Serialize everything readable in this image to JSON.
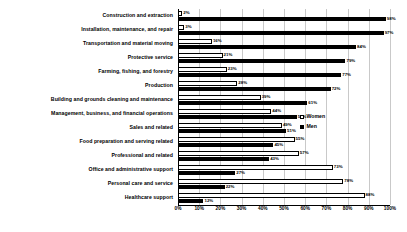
{
  "chart_data": {
    "type": "bar",
    "orientation": "horizontal",
    "title": "",
    "xlabel": "",
    "ylabel": "",
    "xlim": [
      0,
      100
    ],
    "grid": true,
    "legend_position": "right",
    "tick_labels": [
      "0%",
      "10%",
      "20%",
      "30%",
      "40%",
      "50%",
      "60%",
      "70%",
      "80%",
      "90%",
      "100%"
    ],
    "tick_values": [
      0,
      10,
      20,
      30,
      40,
      50,
      60,
      70,
      80,
      90,
      100
    ],
    "categories": [
      "Construction and extraction",
      "Installation, maintenance, and repair",
      "Transportation and material moving",
      "Protective service",
      "Farming, fishing, and forestry",
      "Production",
      "Building and grounds cleaning and maintenance",
      "Management, business, and financial operations",
      "Sales and related",
      "Food preparation and serving related",
      "Professional and related",
      "Office and administrative support",
      "Personal care and service",
      "Healthcare support"
    ],
    "series": [
      {
        "name": "Women",
        "color": "#ffffff",
        "values": [
          2,
          3,
          16,
          21,
          23,
          28,
          39,
          44,
          49,
          55,
          57,
          73,
          78,
          88
        ],
        "labels": [
          "2%",
          "3%",
          "16%",
          "21%",
          "23%",
          "28%",
          "39%",
          "44%",
          "49%",
          "55%",
          "57%",
          "73%",
          "78%",
          "88%"
        ]
      },
      {
        "name": "Men",
        "color": "#000000",
        "values": [
          98,
          97,
          84,
          79,
          77,
          72,
          61,
          56,
          51,
          45,
          43,
          27,
          22,
          12
        ],
        "labels": [
          "98%",
          "97%",
          "84%",
          "79%",
          "77%",
          "72%",
          "61%",
          "56%",
          "51%",
          "45%",
          "43%",
          "27%",
          "22%",
          "12%"
        ]
      }
    ]
  },
  "legend": {
    "items": [
      {
        "label": "Women",
        "swatch": "women"
      },
      {
        "label": "Men",
        "swatch": "men"
      }
    ]
  }
}
